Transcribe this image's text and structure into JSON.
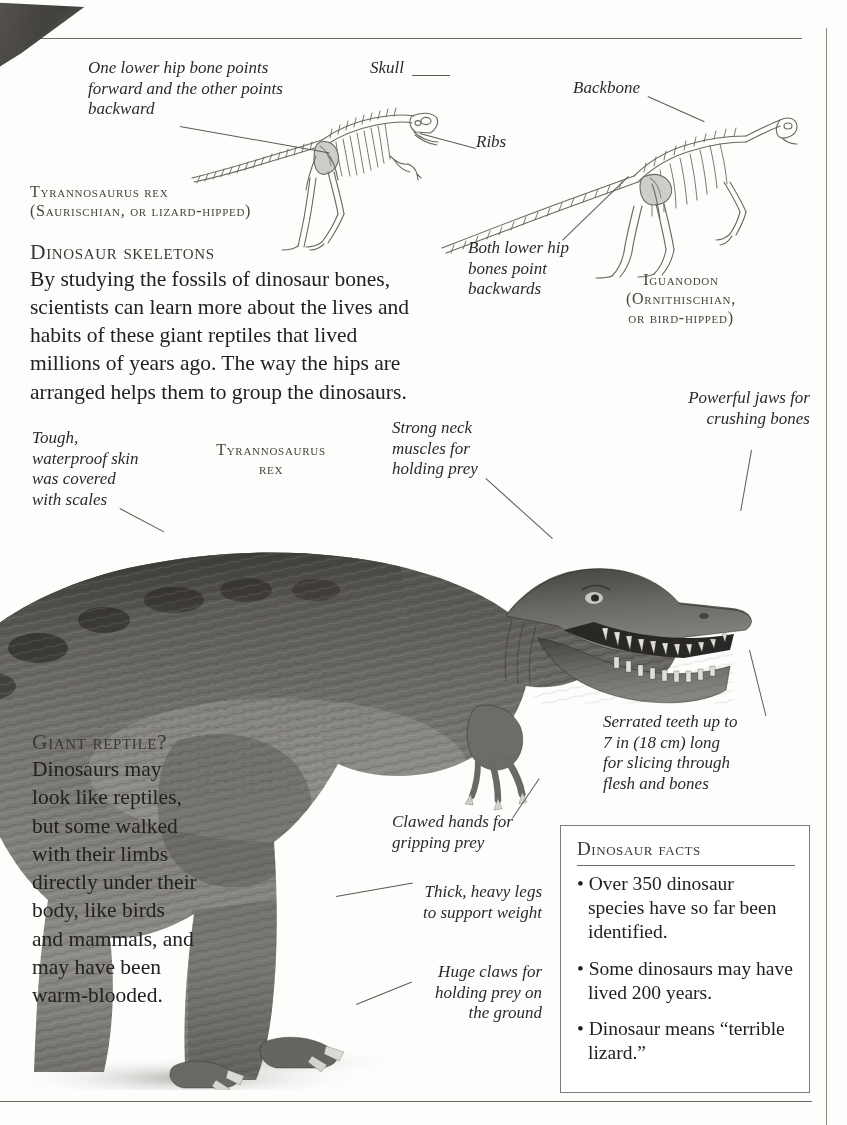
{
  "page": {
    "topic": "Dinosaurs",
    "background_color": "#fdfdfc",
    "rule_color": "#6d6b67"
  },
  "skeleton_section": {
    "heading": "Dinosaur skeletons",
    "paragraph": "By studying the fossils of dinosaur bones, scientists can learn more about the lives and habits of these giant reptiles that lived millions of years ago. The way the hips are arranged helps them to group the dinosaurs.",
    "labels": {
      "hip_bone": "One lower hip bone points forward and the other points backward",
      "skull": "Skull",
      "ribs": "Ribs",
      "backbone": "Backbone",
      "both_lower": "Both lower hip bones point backwards"
    },
    "captions": {
      "tyrannosaurus_line1": "Tyrannosaurus rex",
      "tyrannosaurus_line2": "(Saurischian, or lizard-hipped)",
      "iguanodon_line1": "Iguanodon",
      "iguanodon_line2": "(Ornithischian,",
      "iguanodon_line3": "or bird-hipped)"
    }
  },
  "photo_section": {
    "caption_line1": "Tyrannosaurus",
    "caption_line2": "rex",
    "labels": {
      "skin": "Tough, waterproof skin was covered with scales",
      "neck": "Strong neck muscles for holding prey",
      "jaws": "Powerful jaws for crushing bones",
      "teeth": "Serrated teeth up to 7 in (18 cm) long for slicing through flesh and bones",
      "clawed_hands": "Clawed hands for gripping prey",
      "legs": "Thick, heavy legs to support weight",
      "claws": "Huge claws for holding prey on the ground"
    }
  },
  "giant_reptile": {
    "heading": "Giant reptile?",
    "paragraph": "Dinosaurs may look like reptiles, but some walked with their limbs directly under their body, like birds and mammals, and may have been warm-blooded."
  },
  "facts": {
    "title": "Dinosaur facts",
    "items": [
      "• Over 350 dinosaur species have so far been identified.",
      "• Some dinosaurs may have lived 200 years.",
      "• Dinosaur means “terrible lizard.”"
    ]
  }
}
